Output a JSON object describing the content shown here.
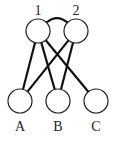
{
  "diagram": {
    "type": "bipartite-graph",
    "top_nodes": [
      {
        "id": "1",
        "label": "1",
        "cx": 38,
        "cy": 31,
        "r": 12,
        "label_x": 38,
        "label_y": 15
      },
      {
        "id": "2",
        "label": "2",
        "cx": 76,
        "cy": 31,
        "r": 12,
        "label_x": 76,
        "label_y": 15
      }
    ],
    "bottom_nodes": [
      {
        "id": "A",
        "label": "A",
        "cx": 20,
        "cy": 101,
        "r": 12,
        "label_x": 20,
        "label_y": 131
      },
      {
        "id": "B",
        "label": "B",
        "cx": 58,
        "cy": 101,
        "r": 12,
        "label_x": 58,
        "label_y": 131
      },
      {
        "id": "C",
        "label": "C",
        "cx": 96,
        "cy": 101,
        "r": 12,
        "label_x": 96,
        "label_y": 131
      }
    ],
    "edges": [
      {
        "from": "1",
        "to": "A"
      },
      {
        "from": "1",
        "to": "B"
      },
      {
        "from": "1",
        "to": "C"
      },
      {
        "from": "2",
        "to": "A"
      },
      {
        "from": "2",
        "to": "B"
      }
    ],
    "arc": {
      "from": "1",
      "to": "2",
      "style": "curved-top"
    },
    "colors": {
      "stroke": "#111111",
      "fill": "#ffffff",
      "text": "#222222"
    }
  }
}
